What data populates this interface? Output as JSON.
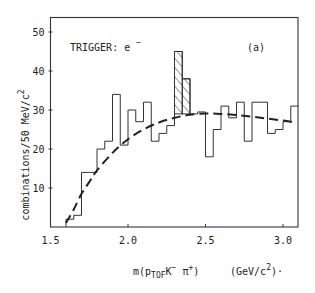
{
  "chart_data": {
    "type": "bar",
    "subtype": "histogram",
    "panel_label": "(a)",
    "annotation": "TRIGGER: e⁻",
    "xlabel": "m(p_TOF K⁻ π⁺)",
    "xlabel_parts": {
      "prefix": "m(p",
      "sub": "TOF",
      "mid": "K",
      "sup1": "−",
      "mid2": " π",
      "sup2": "+",
      "suffix": ")"
    },
    "xunit": "(GeV/c²)",
    "xunit_parts": {
      "prefix": "(GeV/c",
      "sup": "2",
      "suffix": ")·"
    },
    "ylabel": "combinations/50 MeV/c²",
    "ylabel_parts": {
      "text": "combinations/50 MeV/c",
      "sup": "2"
    },
    "xlim": [
      1.5,
      3.1
    ],
    "ylim": [
      0,
      55
    ],
    "xticks": [
      1.5,
      2.0,
      2.5,
      3.0
    ],
    "xtick_labels": [
      "1.5",
      "2.0",
      "2.5",
      "3.0"
    ],
    "yticks": [
      10,
      20,
      30,
      40,
      50
    ],
    "ytick_labels": [
      "10",
      "20",
      "30",
      "40",
      "50"
    ],
    "grid": false,
    "legend": null,
    "bin_width": 0.05,
    "bin_start": 1.6,
    "values": [
      2,
      3,
      14,
      14,
      20,
      22,
      34,
      21,
      30,
      27,
      32,
      22,
      24,
      26,
      45,
      38,
      29,
      29.5,
      18,
      25,
      31,
      28,
      32,
      22,
      32,
      32,
      24,
      25,
      27,
      31
    ],
    "bin_lower_edges": [
      1.6,
      1.65,
      1.7,
      1.75,
      1.8,
      1.85,
      1.9,
      1.95,
      2.0,
      2.05,
      2.1,
      2.15,
      2.2,
      2.25,
      2.3,
      2.35,
      2.4,
      2.45,
      2.5,
      2.55,
      2.6,
      2.65,
      2.7,
      2.75,
      2.8,
      2.85,
      2.9,
      2.95,
      3.0,
      3.05
    ],
    "hatched_signal": {
      "description": "hatched excess above background",
      "bins": [
        {
          "lo": 2.3,
          "hi": 2.35,
          "top": 45,
          "bottom": 29
        },
        {
          "lo": 2.35,
          "hi": 2.4,
          "top": 38,
          "bottom": 29
        }
      ]
    },
    "series": [
      {
        "name": "data histogram",
        "style": "step"
      },
      {
        "name": "background fit",
        "style": "dashed",
        "x": [
          1.6,
          1.65,
          1.7,
          1.75,
          1.8,
          1.9,
          2.0,
          2.1,
          2.2,
          2.3,
          2.4,
          2.5,
          2.6,
          2.7,
          2.8,
          2.9,
          3.0,
          3.08
        ],
        "y": [
          1,
          4.5,
          8.5,
          11.5,
          14.5,
          19,
          22.5,
          25,
          26.8,
          28,
          28.8,
          29.1,
          29,
          28.7,
          28.3,
          27.8,
          27.3,
          26.8
        ]
      }
    ]
  }
}
